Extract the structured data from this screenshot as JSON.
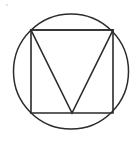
{
  "figure": {
    "title": "Circle with inscribed square and inverted triangle",
    "background_color": "#ffffff",
    "stroke_color": "#2b2b2b",
    "fill": "none",
    "canvas": {
      "width": 140,
      "height": 145
    },
    "shapes": [
      {
        "name": "circle",
        "type": "circle",
        "cx": 71,
        "cy": 71.5,
        "r": 57.5,
        "stroke_width": 1.5,
        "stroke_color": "#2b2b2b",
        "fill": "none"
      },
      {
        "name": "square",
        "type": "rect",
        "x": 31,
        "y": 30,
        "width": 82,
        "height": 83,
        "stroke_width": 1.6,
        "stroke_color": "#2b2b2b",
        "fill": "none",
        "points": "31,30 113,30 113,113 31,113"
      },
      {
        "name": "triangle",
        "type": "polygon",
        "orientation": "inverted",
        "stroke_width": 1.6,
        "stroke_color": "#2b2b2b",
        "fill": "none",
        "points": "31,30 113,30 72,113",
        "vertices": [
          {
            "label": "top-left",
            "x": 31,
            "y": 30
          },
          {
            "label": "top-right",
            "x": 113,
            "y": 30
          },
          {
            "label": "apex-bottom",
            "x": 72,
            "y": 113
          }
        ]
      }
    ],
    "artifacts": [
      {
        "name": "speck",
        "x": 6,
        "y": 4,
        "color": "#cfcfcf"
      }
    ]
  }
}
